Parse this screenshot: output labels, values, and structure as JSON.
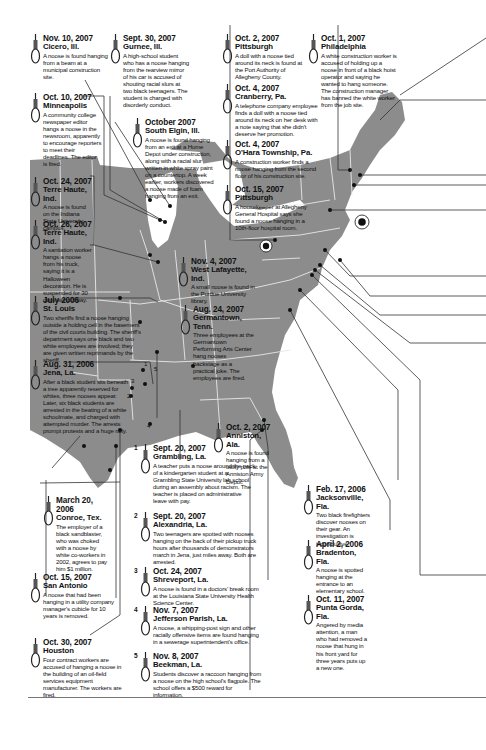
{
  "map": {
    "land_color": "#8c8c8c",
    "border_color": "#e8e8e8",
    "water_color": "#ffffff",
    "line_color": "#333333",
    "point_color": "#111111"
  },
  "incidents": [
    {
      "id": "cicero",
      "date": "Nov. 10, 2007",
      "city": "Cicero, Ill.",
      "body": "A noose is found hanging from a beam at a municipal construction site."
    },
    {
      "id": "gurnee",
      "date": "Sept. 30, 2007",
      "city": "Gurnee, Ill.",
      "body": "A high-school student who has a noose hanging from the rearview mirror of his car is accused of shouting racial slurs at two black teenagers. The student is charged with disorderly conduct."
    },
    {
      "id": "pittsburgh1",
      "date": "Oct. 2, 2007",
      "city": "Pittsburgh",
      "body": "A doll with a noose tied around its neck is found at the Port Authority of Allegheny County."
    },
    {
      "id": "philadelphia",
      "date": "Oct. 1, 2007",
      "city": "Philadelphia",
      "body": "A white construction worker is accused of holding up a noose in front of a black hoist operator and saying he wanted to hang someone. The construction manager has banned the white worker from the job site."
    },
    {
      "id": "minneapolis",
      "date": "Oct. 10, 2007",
      "city": "Minneapolis",
      "body": "A community college newspaper editor hangs a noose in the newsroom, apparently to encourage reporters to meet their deadlines. The editor is fired."
    },
    {
      "id": "southelgin",
      "date": "October 2007",
      "city": "South Elgin, Ill.",
      "body": "A noose is found hanging from an exit at a Home Depot under construction, along with a racial slur written in white spray paint on a countertop. A week earlier, workers discovered a noose made of foam hanging from an exit."
    },
    {
      "id": "cranberry",
      "date": "Oct. 4, 2007",
      "city": "Cranberry, Pa.",
      "body": "A telephone company employee finds a doll with a noose tied around its neck on her desk with a note saying that she didn't deserve her promotion."
    },
    {
      "id": "ohara",
      "date": "Oct. 4, 2007",
      "city": "O'Hara Township, Pa.",
      "body": "A construction worker finds a noose hanging from the second floor of his construction site."
    },
    {
      "id": "pittsburgh2",
      "date": "Oct. 15, 2007",
      "city": "Pittsburgh",
      "body": "A housekeeper at Allegheny General Hospital says she found a noose hanging in a 10th-floor hospital room."
    },
    {
      "id": "terrehaute1",
      "date": "Oct. 24, 2007",
      "city": "Terre Haute, Ind.",
      "body": "A noose is found on the Indiana State University campus."
    },
    {
      "id": "terrehaute2",
      "date": "Oct. 26, 2007",
      "city": "Terre Haute, Ind.",
      "body": "A sanitation worker hangs a noose from his truck, saying it is a Halloween decoration. He is suspended for 30 days without pay."
    },
    {
      "id": "westlafayette",
      "date": "Nov. 4, 2007",
      "city": "West Lafayette, Ind.",
      "body": "A small noose is found in the Purdue University library."
    },
    {
      "id": "stlouis",
      "date": "July 2006",
      "city": "St. Louis",
      "body": "Two sheriffs find a noose hanging outside a holding cell in the basement of the civil courts building. The sheriff's department says one black and two white employees are involved; they are given written reprimands by the sheriff."
    },
    {
      "id": "germantown",
      "date": "Aug. 24, 2007",
      "city": "Germantown, Tenn.",
      "body": "Three employees at the Germantown Performing Arts Center hang nooses backstage as a practical joke. The employees are fired."
    },
    {
      "id": "jena",
      "date": "Aug. 31, 2006",
      "city": "Jena, La.",
      "body": "After a black student sits beneath a tree apparently reserved for whites, three nooses appear. Later, six black students are arrested in the beating of a white schoolmate, and charged with attempted murder. The arrests prompt protests and a huge rally."
    },
    {
      "id": "anniston",
      "date": "Oct. 2, 2007",
      "city": "Anniston, Ala.",
      "body": "A noose is found hanging from a utility pole at the Anniston Army Depot."
    },
    {
      "id": "conroe",
      "date": "March 20, 2006",
      "city": "Conroe, Tex.",
      "body": "The employer of a black sandblaster, who was choked with a noose by white co-workers in 2002, agrees to pay him $1 million."
    },
    {
      "id": "sanantonio",
      "date": "Oct. 15, 2007",
      "city": "San Antonio",
      "body": "A noose that had been hanging in a utility company manager's cubicle for 10 years is removed."
    },
    {
      "id": "houston",
      "date": "Oct. 30, 2007",
      "city": "Houston",
      "body": "Four contract workers are accused of hanging a noose in the building of an oil-field services equipment manufacturer. The workers are fired."
    },
    {
      "id": "grambling",
      "num": "1",
      "date": "Sept. 20, 2007",
      "city": "Grambling, La.",
      "body": "A teacher puts a noose around the neck of a kindergarten student at a Grambling State University lab school during an assembly about racism. The teacher is placed on administrative leave with pay."
    },
    {
      "id": "alexandria",
      "num": "2",
      "date": "Sept. 20, 2007",
      "city": "Alexandria, La.",
      "body": "Two teenagers are spotted with nooses hanging on the back of their pickup truck hours after thousands of demonstrators march in Jena, just miles away. Both are arrested."
    },
    {
      "id": "shreveport",
      "num": "3",
      "date": "Oct. 24, 2007",
      "city": "Shreveport, La.",
      "body": "A noose is found in a doctors' break room at the Louisiana State University Health Science Center."
    },
    {
      "id": "jefferson",
      "num": "4",
      "date": "Nov. 7, 2007",
      "city": "Jefferson Parish, La.",
      "body": "A noose, a whipping-post sign and other racially offensive items are found hanging in a sewerage superintendent's office."
    },
    {
      "id": "beekman",
      "num": "5",
      "date": "Nov. 8, 2007",
      "city": "Beekman, La.",
      "body": "Students discover a raccoon hanging from a noose on the high school's flagpole. The school offers a $500 reward for information."
    },
    {
      "id": "jacksonville",
      "date": "Feb. 17, 2006",
      "city": "Jacksonville, Fla.",
      "body": "Two black firefighters discover nooses on their gear. An investigation is inconclusive."
    },
    {
      "id": "bradenton",
      "date": "April 2, 2006",
      "city": "Bradenton, Fla.",
      "body": "A noose is spotted hanging at the entrance to an elementary school."
    },
    {
      "id": "puntagorda",
      "date": "Oct. 11, 2007",
      "city": "Punta Gorda, Fla.",
      "body": "Angered by media attention, a man who had removed a noose that hung in his front yard for three years puts up a new one."
    }
  ],
  "map_labels": [
    "1",
    "2",
    "3",
    "4",
    "5"
  ]
}
